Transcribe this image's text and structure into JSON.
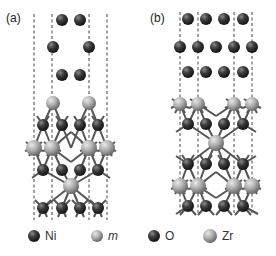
{
  "figure": {
    "panels": [
      {
        "id": "a",
        "label": "(a)"
      },
      {
        "id": "b",
        "label": "(b)"
      }
    ],
    "legend": [
      {
        "symbol": "Ni",
        "label": "Ni",
        "color": "#3a3a3a",
        "italic": false
      },
      {
        "symbol": "m",
        "label": "m",
        "color": "#b8b8b8",
        "italic": true
      },
      {
        "symbol": "O",
        "label": "O",
        "color": "#2e2e2e",
        "italic": false
      },
      {
        "symbol": "Zr",
        "label": "Zr",
        "color": "#a8a8a8",
        "italic": false
      }
    ],
    "colors": {
      "dark_atom": "#383838",
      "light_atom": "#adadad",
      "bond": "#555555",
      "dashed_line": "#444444"
    }
  }
}
